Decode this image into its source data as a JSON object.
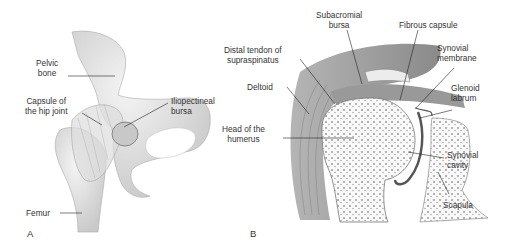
{
  "figure": {
    "panels": [
      {
        "id": "A",
        "label": "A",
        "subject": "hip joint",
        "labels": {
          "pelvic_bone_1": "Pelvic",
          "pelvic_bone_2": "bone",
          "capsule_1": "Capsule of",
          "capsule_2": "the hip joint",
          "iliopectineal_1": "Iliopectineal",
          "iliopectineal_2": "bursa",
          "femur": "Femur"
        }
      },
      {
        "id": "B",
        "label": "B",
        "subject": "shoulder joint",
        "labels": {
          "subacromial_1": "Subacromial",
          "subacromial_2": "bursa",
          "fibrous_capsule": "Fibrous capsule",
          "distal_tendon_1": "Distal tendon of",
          "distal_tendon_2": "supraspinatus",
          "synovial_membrane_1": "Synovial",
          "synovial_membrane_2": "membrane",
          "deltoid": "Deltoid",
          "glenoid_1": "Glenoid",
          "glenoid_2": "labrum",
          "head_1": "Head of the",
          "head_2": "humerus",
          "synovial_cavity_1": "Synovial",
          "synovial_cavity_2": "cavity",
          "scapula": "Scapula"
        }
      }
    ]
  }
}
